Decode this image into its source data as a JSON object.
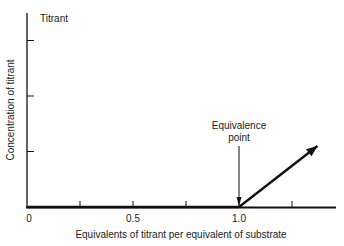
{
  "chart_data": {
    "type": "line",
    "title": "",
    "xlabel": "Equivalents of titrant per equivalent of substrate",
    "ylabel": "Concentration of titrant",
    "xlim": [
      0,
      1.45
    ],
    "ylim": [
      0,
      3.5
    ],
    "x_ticks": [
      0,
      0.25,
      0.5,
      0.75,
      1.0,
      1.25
    ],
    "x_tick_labels": [
      "0",
      "",
      "0.5",
      "",
      "1.0",
      ""
    ],
    "y_ticks": [
      1,
      2,
      3
    ],
    "grid": false,
    "series": [
      {
        "name": "Titrant",
        "x": [
          0,
          1.0,
          1.37
        ],
        "y": [
          0,
          0,
          1.1
        ],
        "arrow_end": true
      }
    ],
    "annotations": [
      {
        "text": "Titrant",
        "anchor": "top-left"
      },
      {
        "text_lines": [
          "Equivalence",
          "point"
        ],
        "x": 1.0,
        "y": 0,
        "arrow": "down"
      }
    ],
    "legend": "none"
  }
}
